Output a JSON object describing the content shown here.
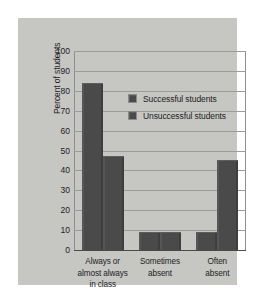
{
  "chart_data": {
    "type": "bar",
    "title": "",
    "xlabel": "",
    "ylabel": "Percent of students",
    "ylim": [
      0,
      100
    ],
    "yticks": [
      100,
      90,
      80,
      70,
      60,
      50,
      40,
      30,
      20,
      10,
      0
    ],
    "grid": true,
    "legend_position": "upper-right-inside",
    "categories": [
      "Always or\nalmost always\nin class",
      "Sometimes\nabsent",
      "Often\nabsent"
    ],
    "category_lines": [
      [
        "Always or",
        "almost always",
        "in class"
      ],
      [
        "Sometimes",
        "absent"
      ],
      [
        "Often",
        "absent"
      ]
    ],
    "series": [
      {
        "name": "Successful students",
        "values": [
          84,
          9,
          9
        ],
        "color": "#4a4a4a"
      },
      {
        "name": "Unsuccessful students",
        "values": [
          47,
          9,
          45
        ],
        "color": "#4a4a4a"
      }
    ]
  },
  "figure": {
    "panel_color": "#c6c6c3",
    "background_color": "#ffffff",
    "gridline_color": "#9b9b98",
    "axis_color": "#4a4a48",
    "text_color": "#1d1d1d"
  }
}
